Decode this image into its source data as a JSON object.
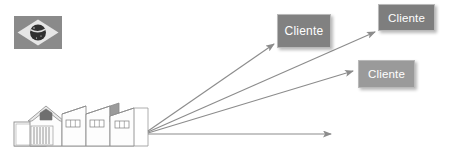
{
  "diagram": {
    "background_color": "#ffffff",
    "line_color": "#8c8c8c",
    "nodes": [
      {
        "id": "flag",
        "name": "brazil-flag",
        "label": "",
        "kind": "image",
        "x": 14,
        "y": 16,
        "width": 48,
        "height": 33,
        "colors": {
          "field": "#8a8a8a",
          "rhombus": "#e8e8e8",
          "globe": "#2f2f2f"
        }
      },
      {
        "id": "factory",
        "name": "factory-buildings",
        "label": "",
        "kind": "image",
        "x": 12,
        "y": 103,
        "width": 136,
        "height": 44,
        "colors": {
          "outline": "#8f8f8f",
          "fill": "#fefefe",
          "shade": "#b5b5b5"
        }
      },
      {
        "id": "cliente-1",
        "name": "cliente-box-1",
        "label": "Cliente",
        "kind": "box",
        "x": 277,
        "y": 14,
        "width": 54,
        "height": 34,
        "fill": "#818181",
        "text_color": "#ffffff"
      },
      {
        "id": "cliente-2",
        "name": "cliente-box-2",
        "label": "Cliente",
        "kind": "box",
        "x": 378,
        "y": 4,
        "width": 57,
        "height": 27,
        "fill": "#7e7e7e",
        "text_color": "#ffffff"
      },
      {
        "id": "cliente-3",
        "name": "cliente-box-3",
        "label": "Cliente",
        "kind": "box",
        "x": 358,
        "y": 60,
        "width": 57,
        "height": 28,
        "fill": "#9a9a9a",
        "text_color": "#ffffff"
      }
    ],
    "arrows": [
      {
        "id": "arrow-1",
        "name": "arrow-to-cliente-1",
        "from": "factory",
        "to": "cliente-1",
        "x1": 148,
        "y1": 131,
        "x2": 274,
        "y2": 44,
        "label": ""
      },
      {
        "id": "arrow-2",
        "name": "arrow-to-cliente-2",
        "from": "factory",
        "to": "cliente-2",
        "x1": 148,
        "y1": 132,
        "x2": 375,
        "y2": 32,
        "label": ""
      },
      {
        "id": "arrow-3",
        "name": "arrow-to-cliente-3",
        "from": "factory",
        "to": "cliente-3",
        "x1": 148,
        "y1": 133,
        "x2": 353,
        "y2": 71,
        "label": ""
      },
      {
        "id": "arrow-4",
        "name": "arrow-horizontal",
        "from": "factory",
        "to": "",
        "x1": 148,
        "y1": 134,
        "x2": 331,
        "y2": 134,
        "label": ""
      }
    ]
  }
}
